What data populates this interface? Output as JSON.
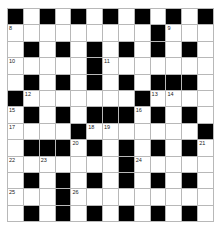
{
  "puzzle": {
    "rows": 13,
    "cols": 13,
    "colors": {
      "block": "#000000",
      "cell": "#ffffff",
      "grid_line": "#b8b8b8"
    },
    "layout": [
      "#.#.#.#.#.#.#",
      ".........#...",
      ".#.#.#.#.#.#.",
      ".....#.......",
      ".#.#.#.#.###.",
      "#.......#....",
      ".#.#.###.#.#.",
      "....#.......#",
      ".###.#.#.#.#.",
      ".......#.....",
      ".#.#.#.#.#.#.",
      "...#.........",
      ".#.#.#.#.#.#."
    ],
    "numbers": [
      {
        "r": 0,
        "c": 0,
        "n": "1"
      },
      {
        "r": 0,
        "c": 2,
        "n": "2"
      },
      {
        "r": 0,
        "c": 4,
        "n": "3"
      },
      {
        "r": 0,
        "c": 6,
        "n": "4"
      },
      {
        "r": 0,
        "c": 8,
        "n": "5"
      },
      {
        "r": 0,
        "c": 10,
        "n": "6"
      },
      {
        "r": 0,
        "c": 12,
        "n": "7"
      },
      {
        "r": 1,
        "c": 0,
        "n": "8"
      },
      {
        "r": 1,
        "c": 10,
        "n": "9"
      },
      {
        "r": 3,
        "c": 0,
        "n": "10"
      },
      {
        "r": 3,
        "c": 6,
        "n": "11"
      },
      {
        "r": 5,
        "c": 1,
        "n": "12"
      },
      {
        "r": 5,
        "c": 9,
        "n": "13"
      },
      {
        "r": 5,
        "c": 10,
        "n": "14"
      },
      {
        "r": 6,
        "c": 0,
        "n": "15"
      },
      {
        "r": 6,
        "c": 8,
        "n": "16"
      },
      {
        "r": 7,
        "c": 0,
        "n": "17"
      },
      {
        "r": 7,
        "c": 5,
        "n": "18"
      },
      {
        "r": 7,
        "c": 6,
        "n": "19"
      },
      {
        "r": 8,
        "c": 4,
        "n": "20"
      },
      {
        "r": 8,
        "c": 12,
        "n": "21"
      },
      {
        "r": 9,
        "c": 0,
        "n": "22"
      },
      {
        "r": 9,
        "c": 2,
        "n": "23"
      },
      {
        "r": 9,
        "c": 8,
        "n": "24"
      },
      {
        "r": 11,
        "c": 0,
        "n": "25"
      },
      {
        "r": 11,
        "c": 4,
        "n": "26"
      }
    ]
  }
}
